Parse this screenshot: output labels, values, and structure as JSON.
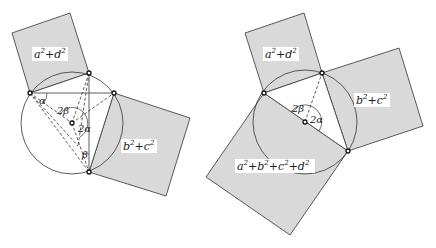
{
  "figures": [
    {
      "id": "left",
      "colors": {
        "square_fill": "#d9d9d9",
        "stroke": "#333333",
        "background": "#ffffff"
      },
      "circle": {
        "cx": 72,
        "cy": 123,
        "r": 51
      },
      "center": {
        "x": 72,
        "y": 123
      },
      "points": {
        "A": {
          "x": 30,
          "y": 93
        },
        "B": {
          "x": 89,
          "y": 73
        },
        "C": {
          "x": 114,
          "y": 93
        },
        "D": {
          "x": 89,
          "y": 172
        }
      },
      "squares": [
        {
          "name": "square-ad",
          "points": "12,33 70,13 89,73 30,93",
          "label": "a²+d²",
          "label_x": 34,
          "label_y": 57
        },
        {
          "name": "square-bc",
          "points": "114,93 190,118 166,196 89,172",
          "label": "b²+c²",
          "label_x": 123,
          "label_y": 149
        }
      ],
      "angle_labels": [
        {
          "text": "α",
          "x": 39,
          "y": 104
        },
        {
          "text": "2β",
          "x": 59,
          "y": 113
        },
        {
          "text": "2α",
          "x": 78,
          "y": 131
        },
        {
          "text": "β",
          "x": 82,
          "y": 157
        }
      ]
    },
    {
      "id": "right",
      "colors": {
        "square_fill": "#d9d9d9",
        "stroke": "#333333",
        "background": "#ffffff"
      },
      "circle": {
        "cx": 305,
        "cy": 122,
        "r": 52
      },
      "center": {
        "x": 305,
        "y": 122
      },
      "points": {
        "P": {
          "x": 264,
          "y": 93
        },
        "Q": {
          "x": 322,
          "y": 73
        },
        "R": {
          "x": 348,
          "y": 151
        }
      },
      "squares": [
        {
          "name": "square-ad",
          "points": "245,33 304,13 322,73 264,93",
          "label": "a²+d²",
          "label_x": 265,
          "label_y": 57
        },
        {
          "name": "square-bc",
          "points": "322,73 399,48 423,126 348,151",
          "label": "b²+c²",
          "label_x": 356,
          "label_y": 103
        },
        {
          "name": "square-abcd",
          "points": "264,93 348,151 290,235 206,177",
          "label": "a²+b²+c²+d²",
          "label_x": 237,
          "label_y": 169
        }
      ],
      "angle_labels": [
        {
          "text": "2β",
          "x": 293,
          "y": 110
        },
        {
          "text": "2α",
          "x": 310,
          "y": 120
        }
      ]
    }
  ]
}
